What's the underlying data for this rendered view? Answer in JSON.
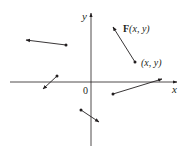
{
  "colors": {
    "ink": "#231f20",
    "background": "#ffffff"
  },
  "axes": {
    "x_label": "x",
    "y_label": "y",
    "origin_label": "0"
  },
  "labels": {
    "field_symbol": "F",
    "field_args": "(x, y)",
    "point_label": "(x, y)"
  },
  "vectors": [
    {
      "name": "vector-upper-left",
      "tail": [
        66,
        45
      ],
      "head": [
        26,
        40
      ]
    },
    {
      "name": "vector-labeled-F",
      "tail": [
        135,
        62
      ],
      "head": [
        113,
        27
      ]
    },
    {
      "name": "vector-left-near-axis",
      "tail": [
        57,
        76
      ],
      "head": [
        43,
        89
      ]
    },
    {
      "name": "vector-right-below-axis",
      "tail": [
        113,
        94
      ],
      "head": [
        162,
        79
      ]
    },
    {
      "name": "vector-bottom-center",
      "tail": [
        81,
        110
      ],
      "head": [
        99,
        122
      ]
    }
  ]
}
